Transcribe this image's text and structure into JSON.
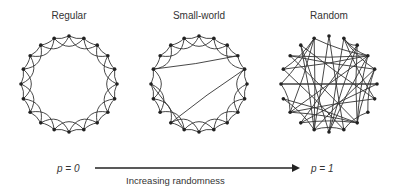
{
  "panels": [
    {
      "title": "Regular",
      "cx": 69,
      "cy": 84,
      "r": 48,
      "n": 20,
      "type": "regular"
    },
    {
      "title": "Small-world",
      "cx": 199,
      "cy": 84,
      "r": 48,
      "n": 20,
      "type": "small-world"
    },
    {
      "title": "Random",
      "cx": 329,
      "cy": 84,
      "r": 48,
      "n": 20,
      "type": "random"
    }
  ],
  "axis": {
    "left_label": "p = 0",
    "right_label": "p = 1",
    "caption": "Increasing randomness"
  }
}
